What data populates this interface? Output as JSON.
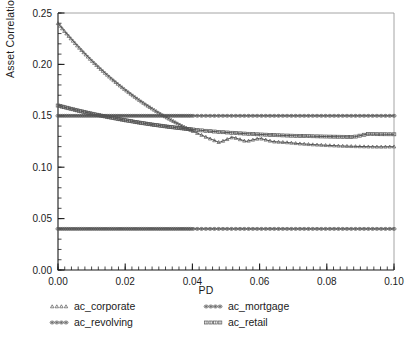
{
  "chart_data": {
    "type": "line",
    "title": "",
    "subtitle": "",
    "xlabel": "PD",
    "ylabel": "Asset Correlation",
    "xlim": [
      0.0,
      0.1
    ],
    "ylim": [
      0.0,
      0.25
    ],
    "xticks": [
      0.0,
      0.02,
      0.04,
      0.06,
      0.08,
      0.1
    ],
    "xtick_labels": [
      "0.00",
      "0.02",
      "0.04",
      "0.06",
      "0.08",
      "0.10"
    ],
    "yticks": [
      0.0,
      0.05,
      0.1,
      0.15,
      0.2,
      0.25
    ],
    "ytick_labels": [
      "0.00",
      "0.05",
      "0.10",
      "0.15",
      "0.20",
      "0.25"
    ],
    "x_minor_tick_step": 0.002,
    "y_minor_tick_step": 0.01,
    "grid": false,
    "legend_position": "bottom",
    "legend_columns": 2,
    "line_color": "#555555",
    "axis_color": "#1b1b1b",
    "background": "#ffffff",
    "x": [
      0.0,
      0.002,
      0.004,
      0.006,
      0.008,
      0.01,
      0.012,
      0.014,
      0.016,
      0.018,
      0.02,
      0.022,
      0.024,
      0.026,
      0.028,
      0.03,
      0.032,
      0.034,
      0.036,
      0.038,
      0.04,
      0.044,
      0.048,
      0.052,
      0.056,
      0.06,
      0.064,
      0.068,
      0.072,
      0.076,
      0.08,
      0.084,
      0.088,
      0.092,
      0.096,
      0.1
    ],
    "series": [
      {
        "name": "ac_corporate",
        "marker": "triangle",
        "values": [
          0.24,
          0.232,
          0.2245,
          0.2173,
          0.2104,
          0.2038,
          0.1976,
          0.1916,
          0.1859,
          0.1805,
          0.1753,
          0.1704,
          0.1657,
          0.1612,
          0.157,
          0.1529,
          0.149,
          0.1454,
          0.1418,
          0.1385,
          0.1353,
          0.1294,
          0.1241,
          0.1293,
          0.1251,
          0.1281,
          0.1249,
          0.1241,
          0.1229,
          0.122,
          0.1213,
          0.1207,
          0.1203,
          0.12,
          0.1198,
          0.12
        ]
      },
      {
        "name": "ac_mortgage",
        "marker": "circle-plus",
        "values": [
          0.15,
          0.15,
          0.15,
          0.15,
          0.15,
          0.15,
          0.15,
          0.15,
          0.15,
          0.15,
          0.15,
          0.15,
          0.15,
          0.15,
          0.15,
          0.15,
          0.15,
          0.15,
          0.15,
          0.15,
          0.15,
          0.15,
          0.15,
          0.15,
          0.15,
          0.15,
          0.15,
          0.15,
          0.15,
          0.15,
          0.15,
          0.15,
          0.15,
          0.15,
          0.15,
          0.15
        ]
      },
      {
        "name": "ac_revolving",
        "marker": "circle-plus",
        "values": [
          0.04,
          0.04,
          0.04,
          0.04,
          0.04,
          0.04,
          0.04,
          0.04,
          0.04,
          0.04,
          0.04,
          0.04,
          0.04,
          0.04,
          0.04,
          0.04,
          0.04,
          0.04,
          0.04,
          0.04,
          0.04,
          0.04,
          0.04,
          0.04,
          0.04,
          0.04,
          0.04,
          0.04,
          0.04,
          0.04,
          0.04,
          0.04,
          0.04,
          0.04,
          0.04,
          0.04
        ]
      },
      {
        "name": "ac_retail",
        "marker": "square-grid",
        "values": [
          0.16,
          0.1583,
          0.1567,
          0.1551,
          0.1536,
          0.1521,
          0.1507,
          0.1494,
          0.1481,
          0.1469,
          0.1457,
          0.1446,
          0.1435,
          0.1425,
          0.1415,
          0.1406,
          0.1397,
          0.1389,
          0.1381,
          0.1374,
          0.1367,
          0.1354,
          0.1343,
          0.1334,
          0.1326,
          0.1319,
          0.1313,
          0.1308,
          0.1304,
          0.1301,
          0.1298,
          0.1296,
          0.1294,
          0.1322,
          0.1321,
          0.132
        ]
      }
    ]
  },
  "legend": {
    "items": [
      {
        "label": "ac_corporate",
        "marker": "triangle"
      },
      {
        "label": "ac_mortgage",
        "marker": "circle-plus"
      },
      {
        "label": "ac_revolving",
        "marker": "circle-plus"
      },
      {
        "label": "ac_retail",
        "marker": "square-grid"
      }
    ]
  }
}
